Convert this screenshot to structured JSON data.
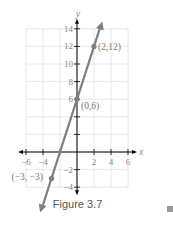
{
  "chart_data": {
    "type": "line",
    "title": "",
    "caption": "Figure 3.7",
    "xlabel": "x",
    "ylabel": "y",
    "xlim": [
      -6,
      6
    ],
    "ylim": [
      -4,
      14
    ],
    "grid": true,
    "x_ticks": [
      -6,
      -4,
      2,
      4,
      6
    ],
    "x_tick_labels": [
      "−6",
      "−4",
      "2",
      "4",
      "6"
    ],
    "y_ticks": [
      14,
      12,
      10,
      8,
      6,
      -2,
      -4
    ],
    "y_tick_labels": [
      "14",
      "12",
      "10",
      "8",
      "6",
      "−2",
      "−4"
    ],
    "series": [
      {
        "name": "y = 3x + 6",
        "slope": 3,
        "intercept": 6,
        "line_extends_both_directions": true,
        "points": [
          {
            "x": -3,
            "y": -3,
            "label": "(−3, −3)"
          },
          {
            "x": 0,
            "y": 6,
            "label": "(0,6)"
          },
          {
            "x": 2,
            "y": 12,
            "label": "(2,12)"
          }
        ]
      }
    ],
    "colors": {
      "line": "#808080",
      "axis": "#000000",
      "grid": "#e2e2e2",
      "text": "#8a8a8a"
    }
  },
  "figure": {
    "caption": "Figure 3.7",
    "end_marker": "end-of-example-square"
  }
}
